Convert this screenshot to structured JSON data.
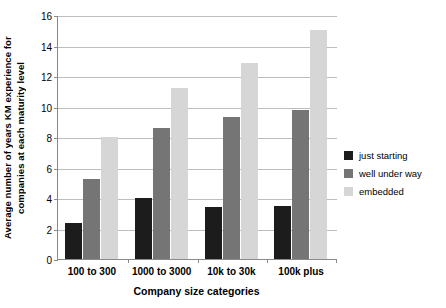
{
  "chart_data": {
    "type": "bar",
    "title": "",
    "subtitle": "",
    "xlabel": "Company size categories",
    "ylabel": "Average number of years KM experience for companies at each maturity level",
    "ylabel_lines": [
      "Average number of years KM experience for",
      "companies at each maturity level"
    ],
    "categories": [
      "100 to 300",
      "1000 to 3000",
      "10k to 30k",
      "100k plus"
    ],
    "series": [
      {
        "name": "just starting",
        "color": "#1c1c1c",
        "values": [
          2.35,
          4.0,
          3.4,
          3.45
        ]
      },
      {
        "name": "well under way",
        "color": "#757575",
        "values": [
          5.25,
          8.6,
          9.3,
          9.8
        ]
      },
      {
        "name": "embedded",
        "color": "#d6d6d6",
        "values": [
          8.0,
          11.2,
          12.85,
          15.0
        ]
      }
    ],
    "ylim": [
      0,
      16
    ],
    "yticks": [
      0,
      2,
      4,
      6,
      8,
      10,
      12,
      14,
      16
    ],
    "ytick_labels": [
      "0",
      "2",
      "4",
      "6",
      "8",
      "10",
      "12",
      "14",
      "16"
    ],
    "grid": true,
    "grid_axis": "y",
    "legend_position": "right"
  },
  "legend": {
    "items": [
      {
        "label": "just starting",
        "color": "#1c1c1c"
      },
      {
        "label": "well under way",
        "color": "#757575"
      },
      {
        "label": "embedded",
        "color": "#d6d6d6"
      }
    ]
  },
  "artifacts": {
    "top": "",
    "right": ""
  }
}
